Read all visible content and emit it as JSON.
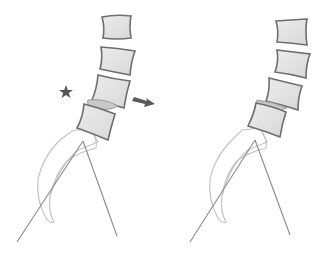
{
  "diagram": {
    "type": "spine-illustration",
    "panels": [
      {
        "id": "left",
        "label": "",
        "vertebrae_count": 4,
        "has_disc_highlight": true,
        "annotations": [
          "star-marker",
          "arrow-right"
        ]
      },
      {
        "id": "right",
        "label": "",
        "vertebrae_count": 4,
        "has_disc_highlight": true,
        "annotations": []
      }
    ],
    "colors": {
      "vertebra_fill": "#e4e4e4",
      "vertebra_stroke": "#6e6e6e",
      "disc_fill": "#c8c8c8",
      "pelvis_stroke": "#c4c4c4",
      "line_stroke": "#8a8a8a",
      "star_fill": "#555555",
      "arrow_fill": "#5a5a5a",
      "background": "#ffffff"
    }
  }
}
